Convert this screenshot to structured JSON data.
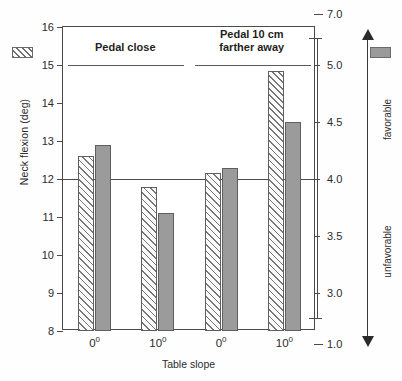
{
  "chart_data": {
    "type": "bar",
    "title": "",
    "categories": [
      "0°",
      "10°",
      "0°",
      "10°"
    ],
    "group_headers": [
      {
        "label": "Pedal close",
        "line1": "Pedal close",
        "line2": "",
        "categories": [
          "0°",
          "10°"
        ]
      },
      {
        "label": "Pedal 10 cm farther away",
        "line1": "Pedal 10 cm",
        "line2": "farther away",
        "categories": [
          "0°",
          "10°"
        ]
      }
    ],
    "series": [
      {
        "name": "Neck flexion (deg)",
        "pattern": "hatched",
        "axis": "left",
        "values": [
          12.6,
          11.8,
          12.15,
          14.85
        ],
        "color": "#fbfbfb",
        "hatch_color": "#777777"
      },
      {
        "name": "Perceived posture of the neck",
        "pattern": "solid",
        "axis": "right",
        "values_left_axis_coords": [
          12.9,
          11.1,
          12.3,
          13.5
        ],
        "values": [
          4.3,
          3.7,
          4.1,
          4.5
        ],
        "color": "#9b9b9b"
      }
    ],
    "xlabel": "Table slope",
    "ylabel": "Neck flexion (deg)",
    "ylabel_right": "Perceived posture of the neck",
    "ylim": [
      8,
      16
    ],
    "yticks": [
      8,
      9,
      10,
      11,
      12,
      13,
      14,
      15,
      16
    ],
    "ytick_labels": [
      "8",
      "9",
      "10",
      "11",
      "12",
      "13",
      "14",
      "15",
      "16"
    ],
    "right_axis": {
      "broken": true,
      "tick_labels": [
        "7.0",
        "5.0",
        "4.5",
        "4.0",
        "3.5",
        "3.0",
        "1.0"
      ],
      "tick_values": [
        7.0,
        5.0,
        4.5,
        4.0,
        3.5,
        3.0,
        1.0
      ],
      "tick_left_positions": [
        16.35,
        15.0,
        13.5,
        12.0,
        10.5,
        9.0,
        7.65
      ],
      "break_positions_left_coords": [
        15.7,
        8.35
      ]
    },
    "reference_line": {
      "left_value": 12,
      "right_value": 4.0
    },
    "grid": false,
    "legend": {
      "position": "top-corners",
      "entries": [
        {
          "name": "Neck flexion (deg)",
          "pattern": "hatched",
          "corner": "left"
        },
        {
          "name": "Perceived posture of the neck",
          "pattern": "solid",
          "corner": "right"
        }
      ]
    },
    "annotations": {
      "favorable": "favorable",
      "unfavorable": "unfavorable",
      "arrow": "double-headed vertical arrow"
    }
  }
}
